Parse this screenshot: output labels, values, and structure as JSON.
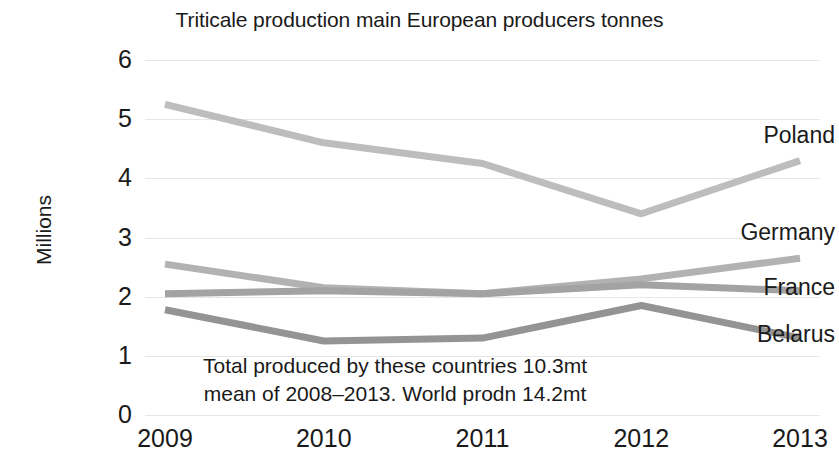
{
  "chart_data": {
    "type": "line",
    "title": "Triticale production main European producers tonnes",
    "xlabel": "",
    "ylabel": "Millions",
    "categories": [
      "2009",
      "2010",
      "2011",
      "2012",
      "2013"
    ],
    "x": [
      2009,
      2010,
      2011,
      2012,
      2013
    ],
    "ylim": [
      0,
      6
    ],
    "yticks": [
      "0",
      "1",
      "2",
      "3",
      "4",
      "5",
      "6"
    ],
    "grid": true,
    "legend_position": "right-inline-labels",
    "series": [
      {
        "name": "Poland",
        "values": [
          5.25,
          4.6,
          4.25,
          3.4,
          4.3
        ],
        "color": "#bdbdbd"
      },
      {
        "name": "Germany",
        "values": [
          2.55,
          2.15,
          2.05,
          2.3,
          2.65
        ],
        "color": "#b2b2b2"
      },
      {
        "name": "France",
        "values": [
          2.05,
          2.1,
          2.05,
          2.2,
          2.1
        ],
        "color": "#a3a3a3"
      },
      {
        "name": "Belarus",
        "values": [
          1.78,
          1.25,
          1.3,
          1.85,
          1.3
        ],
        "color": "#949494"
      }
    ],
    "annotations": [
      "Total produced by these countries 10.3mt",
      "mean of 2008–2013. World prodn 14.2mt"
    ]
  },
  "axis": {
    "y_title": "Millions"
  },
  "colors": {
    "background": "#ffffff",
    "text": "#1a1a1a",
    "gridline": "#e6e6e6"
  }
}
